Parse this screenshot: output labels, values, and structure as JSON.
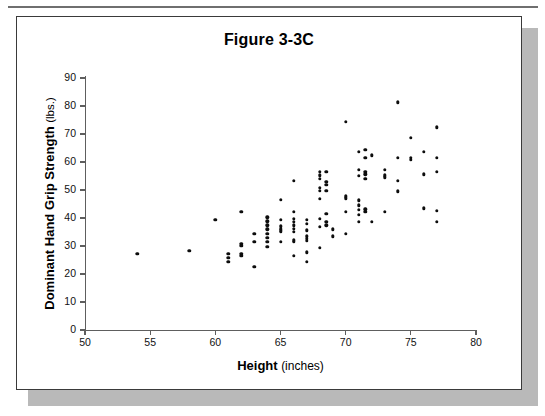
{
  "page": {
    "background_color": "#ffffff",
    "card_border_color": "#3a3a3a",
    "shadow_color": "#b9b9b9",
    "rule_color": "#6f6f6f"
  },
  "chart_data": {
    "type": "scatter",
    "title": "Figure 3-3C",
    "xlabel_bold": "Height",
    "xlabel_light": "(inches)",
    "ylabel_bold": "Dominant Hand Grip Strength",
    "ylabel_light": "(lbs.)",
    "xlim": [
      50,
      80
    ],
    "ylim": [
      0,
      90
    ],
    "xticks": [
      50,
      55,
      60,
      65,
      70,
      75,
      80
    ],
    "yticks": [
      0,
      10,
      20,
      30,
      40,
      50,
      60,
      70,
      80,
      90
    ],
    "grid": false,
    "legend": null,
    "marker_color": "#0d0d0d",
    "axis_color": "#5e5e5e",
    "points": [
      [
        54.0,
        27.2
      ],
      [
        58.0,
        28.3
      ],
      [
        60.0,
        39.4
      ],
      [
        61.0,
        27.2
      ],
      [
        61.0,
        25.8
      ],
      [
        61.0,
        24.4
      ],
      [
        62.0,
        42.3
      ],
      [
        62.0,
        30.8
      ],
      [
        62.0,
        30.0
      ],
      [
        62.0,
        27.2
      ],
      [
        62.0,
        26.4
      ],
      [
        63.0,
        34.3
      ],
      [
        63.0,
        31.5
      ],
      [
        63.0,
        22.5
      ],
      [
        64.0,
        40.2
      ],
      [
        64.0,
        38.8
      ],
      [
        64.0,
        37.4
      ],
      [
        64.0,
        36.0
      ],
      [
        64.0,
        34.3
      ],
      [
        64.0,
        32.9
      ],
      [
        64.0,
        31.5
      ],
      [
        64.0,
        29.8
      ],
      [
        65.0,
        46.6
      ],
      [
        65.0,
        39.4
      ],
      [
        65.0,
        37.0
      ],
      [
        65.0,
        36.2
      ],
      [
        65.0,
        35.6
      ],
      [
        65.0,
        35.0
      ],
      [
        65.0,
        31.5
      ],
      [
        66.0,
        53.3
      ],
      [
        66.0,
        42.3
      ],
      [
        66.0,
        39.8
      ],
      [
        66.0,
        38.6
      ],
      [
        66.0,
        37.4
      ],
      [
        66.0,
        36.2
      ],
      [
        66.0,
        35.0
      ],
      [
        66.0,
        32.0
      ],
      [
        66.0,
        31.5
      ],
      [
        66.0,
        26.6
      ],
      [
        67.0,
        39.4
      ],
      [
        67.0,
        38.0
      ],
      [
        67.0,
        35.6
      ],
      [
        67.0,
        33.4
      ],
      [
        67.0,
        32.6
      ],
      [
        67.0,
        31.8
      ],
      [
        67.0,
        27.8
      ],
      [
        67.0,
        24.4
      ],
      [
        68.0,
        56.6
      ],
      [
        68.0,
        55.3
      ],
      [
        68.0,
        54.1
      ],
      [
        68.0,
        50.8
      ],
      [
        68.0,
        49.7
      ],
      [
        68.0,
        46.9
      ],
      [
        68.0,
        39.8
      ],
      [
        68.0,
        36.8
      ],
      [
        68.0,
        29.4
      ],
      [
        68.5,
        56.6
      ],
      [
        68.5,
        53.0
      ],
      [
        68.5,
        51.8
      ],
      [
        68.5,
        49.7
      ],
      [
        68.5,
        41.5
      ],
      [
        68.5,
        38.6
      ],
      [
        68.5,
        37.4
      ],
      [
        69.0,
        36.0
      ],
      [
        69.0,
        33.4
      ],
      [
        70.0,
        74.3
      ],
      [
        70.0,
        47.8
      ],
      [
        70.0,
        47.0
      ],
      [
        70.0,
        42.3
      ],
      [
        70.0,
        34.3
      ],
      [
        71.0,
        63.6
      ],
      [
        71.0,
        57.2
      ],
      [
        71.0,
        55.0
      ],
      [
        71.0,
        46.3
      ],
      [
        71.0,
        44.5
      ],
      [
        71.0,
        42.9
      ],
      [
        71.0,
        41.1
      ],
      [
        71.0,
        38.6
      ],
      [
        71.5,
        64.4
      ],
      [
        71.5,
        61.5
      ],
      [
        71.5,
        56.6
      ],
      [
        71.5,
        55.6
      ],
      [
        71.5,
        54.1
      ],
      [
        71.5,
        43.1
      ],
      [
        71.5,
        42.3
      ],
      [
        72.0,
        62.4
      ],
      [
        72.0,
        38.6
      ],
      [
        73.0,
        57.2
      ],
      [
        73.0,
        55.3
      ],
      [
        73.0,
        54.6
      ],
      [
        73.0,
        42.3
      ],
      [
        74.0,
        81.3
      ],
      [
        74.0,
        61.5
      ],
      [
        74.0,
        53.3
      ],
      [
        74.0,
        49.5
      ],
      [
        75.0,
        68.6
      ],
      [
        75.0,
        61.5
      ],
      [
        75.0,
        60.7
      ],
      [
        76.0,
        63.6
      ],
      [
        76.0,
        55.6
      ],
      [
        76.0,
        43.5
      ],
      [
        77.0,
        72.4
      ],
      [
        77.0,
        61.5
      ],
      [
        77.0,
        56.4
      ],
      [
        77.0,
        42.5
      ],
      [
        77.0,
        38.6
      ]
    ]
  }
}
